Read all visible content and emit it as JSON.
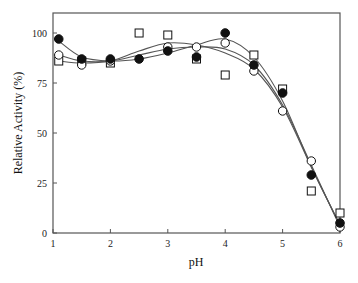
{
  "chart_data": {
    "type": "scatter",
    "title": "",
    "xlabel": "pH",
    "ylabel": "Relative Activity (%)",
    "xlim": [
      1,
      6
    ],
    "ylim": [
      0,
      110
    ],
    "xticks": [
      1,
      2,
      3,
      4,
      5,
      6
    ],
    "yticks": [
      0,
      25,
      50,
      75,
      100
    ],
    "grid": false,
    "legend": null,
    "series": [
      {
        "name": "filled-circle",
        "marker": "filled-circle",
        "fit": "smooth-curve",
        "x": [
          1.1,
          1.5,
          2.0,
          2.5,
          3.0,
          3.5,
          4.0,
          4.5,
          5.0,
          5.5,
          6.0
        ],
        "y": [
          97,
          87,
          87,
          87,
          91,
          88,
          100,
          84,
          70,
          29,
          5
        ]
      },
      {
        "name": "open-circle",
        "marker": "open-circle",
        "fit": "smooth-curve",
        "x": [
          1.1,
          1.5,
          2.0,
          3.0,
          3.5,
          4.0,
          4.5,
          5.0,
          5.5,
          6.0
        ],
        "y": [
          89,
          84,
          86,
          93,
          93,
          95,
          81,
          61,
          36,
          3
        ]
      },
      {
        "name": "open-square",
        "marker": "open-square",
        "fit": "smooth-curve",
        "x": [
          1.1,
          1.5,
          2.0,
          2.5,
          3.0,
          3.5,
          4.0,
          4.5,
          5.0,
          5.5,
          6.0
        ],
        "y": [
          86,
          86,
          85,
          100,
          99,
          87,
          79,
          89,
          72,
          21,
          10
        ]
      }
    ],
    "curves": [
      {
        "name": "filled-circle-fit",
        "x": [
          1.1,
          1.5,
          2.0,
          2.5,
          3.0,
          3.5,
          4.0,
          4.5,
          5.0,
          5.5,
          6.0
        ],
        "y": [
          96,
          88,
          86,
          87,
          90,
          94,
          97,
          88,
          66,
          33,
          4
        ]
      },
      {
        "name": "open-circle-fit",
        "x": [
          1.1,
          1.5,
          2.0,
          2.5,
          3.0,
          3.5,
          4.0,
          4.5,
          5.0,
          5.5,
          6.0
        ],
        "y": [
          89,
          86,
          86,
          89,
          92,
          93,
          92,
          84,
          64,
          34,
          3
        ]
      },
      {
        "name": "open-square-fit",
        "x": [
          1.1,
          1.5,
          2.0,
          2.5,
          3.0,
          3.5,
          4.0,
          4.5,
          5.0,
          5.5,
          6.0
        ],
        "y": [
          86,
          85,
          86,
          91,
          95,
          94,
          90,
          82,
          63,
          33,
          4
        ]
      }
    ]
  },
  "axes": {
    "x_title": "pH",
    "y_title": "Relative Activity (%)",
    "x_tick_labels": [
      "1",
      "2",
      "3",
      "4",
      "5",
      "6"
    ],
    "y_tick_labels": [
      "0",
      "25",
      "50",
      "75",
      "100"
    ]
  },
  "colors": {
    "axis": "#555555",
    "marker": "#111111",
    "curve": "#555555",
    "background": "#ffffff"
  }
}
